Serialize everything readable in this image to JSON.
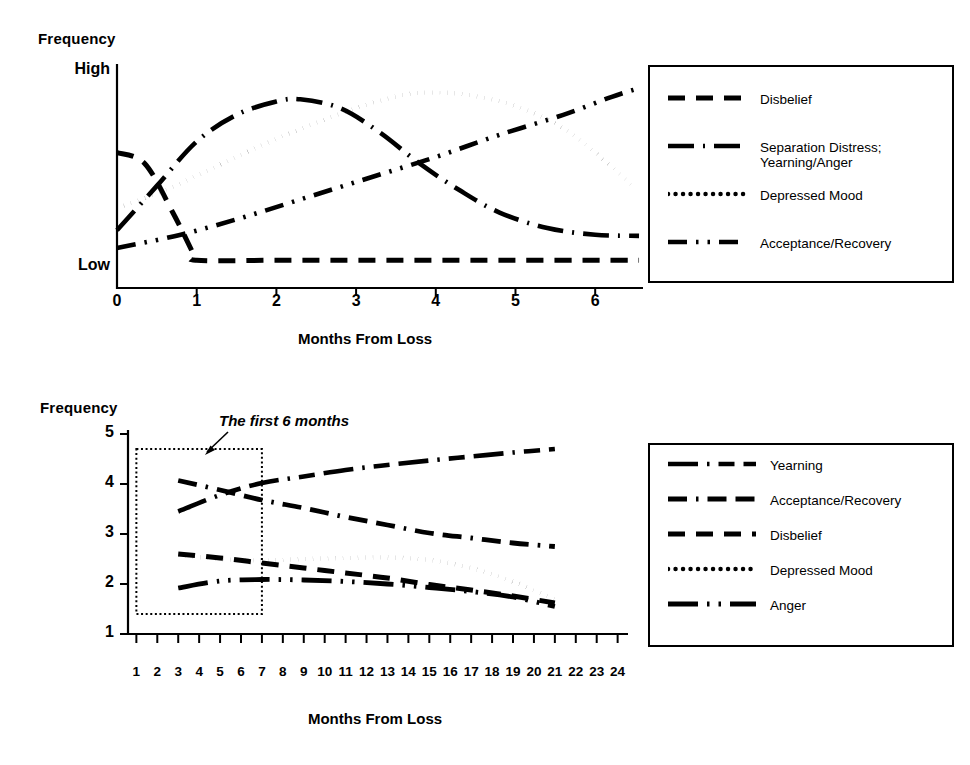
{
  "figure": {
    "background": "#ffffff",
    "ink": "#000000"
  },
  "top_chart": {
    "ylabel": "Frequency",
    "y_high_label": "High",
    "y_low_label": "Low",
    "xlabel": "Months From Loss",
    "xticks": [
      "0",
      "1",
      "2",
      "3",
      "4",
      "5",
      "6"
    ],
    "legend": {
      "items": [
        {
          "label": "Disbelief",
          "style": "dashed"
        },
        {
          "label": "Separation Distress;\nYearning/Anger",
          "style": "long-dash-dot"
        },
        {
          "label": "Depressed Mood",
          "style": "dotted"
        },
        {
          "label": "Acceptance/Recovery",
          "style": "dash-dot-dot"
        }
      ]
    }
  },
  "bottom_chart": {
    "ylabel": "Frequency",
    "xlabel": "Months From Loss",
    "annotation": "The first 6 months",
    "yticks": [
      "5",
      "4",
      "3",
      "2",
      "1"
    ],
    "xticks": [
      "1",
      "2",
      "3",
      "4",
      "5",
      "6",
      "7",
      "8",
      "9",
      "10",
      "11",
      "12",
      "13",
      "14",
      "15",
      "16",
      "17",
      "18",
      "19",
      "20",
      "21",
      "22",
      "23",
      "24"
    ],
    "legend": {
      "items": [
        {
          "label": "Yearning",
          "style": "long-dash-dot-dash"
        },
        {
          "label": "Acceptance/Recovery",
          "style": "dash-dot-dash"
        },
        {
          "label": "Disbelief",
          "style": "dashed"
        },
        {
          "label": "Depressed Mood",
          "style": "dotted"
        },
        {
          "label": "Anger",
          "style": "long-dash-dot-dot"
        }
      ]
    }
  },
  "chart_data": [
    {
      "type": "line",
      "id": "top",
      "title": "",
      "xlabel": "Months From Loss",
      "ylabel": "Frequency",
      "xlim": [
        0,
        6.6
      ],
      "ylim": [
        0,
        10
      ],
      "ytick_labels": [
        "Low",
        "High"
      ],
      "ytick_values": [
        1.3,
        9.6
      ],
      "xtick_values": [
        0,
        1,
        2,
        3,
        4,
        5,
        6
      ],
      "grid": false,
      "legend_position": "right",
      "series": [
        {
          "name": "Disbelief",
          "style": "dashed",
          "x": [
            0,
            0.35,
            0.7,
            0.95,
            1.0,
            2,
            3,
            4,
            5,
            6,
            6.55
          ],
          "y": [
            6.1,
            5.6,
            3.4,
            1.6,
            1.25,
            1.25,
            1.25,
            1.25,
            1.25,
            1.25,
            1.25
          ]
        },
        {
          "name": "Separation Distress; Yearning/Anger",
          "style": "long-dash-dot",
          "x": [
            0,
            0.5,
            1.0,
            1.5,
            2.0,
            2.3,
            2.8,
            3.3,
            3.8,
            4.3,
            4.8,
            5.4,
            6.0,
            6.55
          ],
          "y": [
            2.6,
            4.6,
            6.6,
            7.8,
            8.4,
            8.5,
            8.1,
            7.0,
            5.6,
            4.4,
            3.4,
            2.7,
            2.4,
            2.35
          ]
        },
        {
          "name": "Depressed Mood",
          "style": "dotted",
          "x": [
            0,
            0.6,
            1.2,
            1.8,
            2.4,
            3.0,
            3.6,
            4.0,
            4.4,
            5.0,
            5.6,
            6.1,
            6.5
          ],
          "y": [
            3.6,
            4.4,
            5.4,
            6.4,
            7.3,
            8.1,
            8.7,
            8.8,
            8.7,
            8.2,
            7.2,
            5.8,
            4.5
          ]
        },
        {
          "name": "Acceptance/Recovery",
          "style": "dash-dot-dot",
          "x": [
            0,
            0.8,
            1.6,
            2.4,
            3.2,
            4.0,
            4.8,
            5.6,
            6.2,
            6.55
          ],
          "y": [
            1.8,
            2.4,
            3.2,
            4.1,
            5.0,
            5.9,
            6.9,
            7.8,
            8.6,
            9.0
          ]
        }
      ]
    },
    {
      "type": "line",
      "id": "bottom",
      "title": "",
      "xlabel": "Months From Loss",
      "ylabel": "Frequency",
      "xlim": [
        0.6,
        24.4
      ],
      "ylim": [
        1,
        5
      ],
      "ytick_values": [
        1,
        2,
        3,
        4,
        5
      ],
      "xtick_values": [
        1,
        2,
        3,
        4,
        5,
        6,
        7,
        8,
        9,
        10,
        11,
        12,
        13,
        14,
        15,
        16,
        17,
        18,
        19,
        20,
        21,
        22,
        23,
        24
      ],
      "grid": false,
      "legend_position": "right",
      "highlight_box": {
        "x_range": [
          1,
          7
        ],
        "y_range": [
          1.4,
          4.7
        ],
        "label": "The first 6 months"
      },
      "series": [
        {
          "name": "Yearning",
          "style": "long-dash-dot-dash",
          "x": [
            3,
            5,
            7,
            9,
            11,
            13,
            15,
            17,
            19,
            21
          ],
          "y": [
            3.45,
            3.78,
            4.02,
            4.15,
            4.28,
            4.38,
            4.47,
            4.55,
            4.63,
            4.7
          ]
        },
        {
          "name": "Acceptance/Recovery",
          "style": "dash-dot-dash",
          "x": [
            3,
            5,
            7,
            9,
            11,
            13,
            15,
            17,
            19,
            21
          ],
          "y": [
            4.07,
            3.88,
            3.68,
            3.52,
            3.34,
            3.18,
            3.02,
            2.92,
            2.82,
            2.75
          ]
        },
        {
          "name": "Disbelief",
          "style": "dashed",
          "x": [
            3,
            5,
            7,
            9,
            11,
            13,
            15,
            17,
            19,
            21
          ],
          "y": [
            2.6,
            2.52,
            2.42,
            2.32,
            2.22,
            2.12,
            1.99,
            1.88,
            1.76,
            1.62
          ]
        },
        {
          "name": "Depressed Mood",
          "style": "dotted",
          "x": [
            3,
            5,
            7,
            9,
            11,
            13,
            15,
            17,
            19,
            21
          ],
          "y": [
            2.58,
            2.5,
            2.47,
            2.5,
            2.52,
            2.53,
            2.48,
            2.32,
            2.05,
            1.7
          ]
        },
        {
          "name": "Anger",
          "style": "long-dash-dot-dot",
          "x": [
            3,
            5,
            7,
            9,
            11,
            13,
            15,
            17,
            19,
            21
          ],
          "y": [
            1.92,
            2.06,
            2.09,
            2.08,
            2.05,
            2.0,
            1.93,
            1.85,
            1.74,
            1.55
          ]
        }
      ]
    }
  ]
}
